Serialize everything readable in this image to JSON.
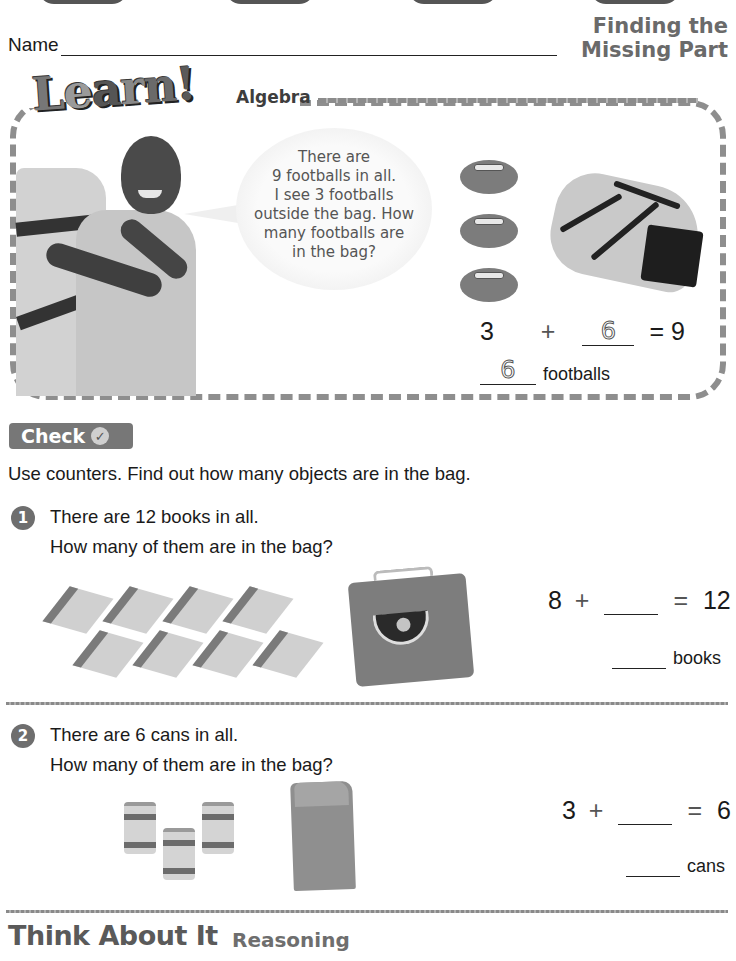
{
  "header": {
    "name_label": "Name",
    "lesson_title_line1": "Finding the",
    "lesson_title_line2": "Missing Part"
  },
  "learn": {
    "logo_letters": [
      "L",
      "e",
      "a",
      "r",
      "n",
      "!"
    ],
    "strand": "Algebra",
    "speech_lines": [
      "There are",
      "9 footballs in all.",
      "I see 3 footballs",
      "outside the bag. How",
      "many footballs are",
      "in the bag?"
    ],
    "footballs_outside": 3,
    "equation": {
      "addend1": "3",
      "plus": "+",
      "answer": "6",
      "equals": "= 9"
    },
    "answer_value": "6",
    "answer_unit": "footballs"
  },
  "check": {
    "label": "Check",
    "icon": "checkmark-icon",
    "icon_glyph": "✓",
    "instructions": "Use counters. Find out how many objects are in the bag."
  },
  "questions": [
    {
      "number": "1",
      "line1": "There are 12 books in all.",
      "line2": "How many of them are in the bag?",
      "objects_outside": 8,
      "equation": {
        "addend1": "8",
        "plus": "+",
        "equals": "=",
        "total": "12"
      },
      "unit": "books"
    },
    {
      "number": "2",
      "line1": "There are 6 cans in all.",
      "line2": "How many of them are in the bag?",
      "objects_outside": 3,
      "equation": {
        "addend1": "3",
        "plus": "+",
        "equals": "=",
        "total": "6"
      },
      "unit": "cans"
    }
  ],
  "think": {
    "title": "Think About It",
    "subtitle": "Reasoning"
  }
}
